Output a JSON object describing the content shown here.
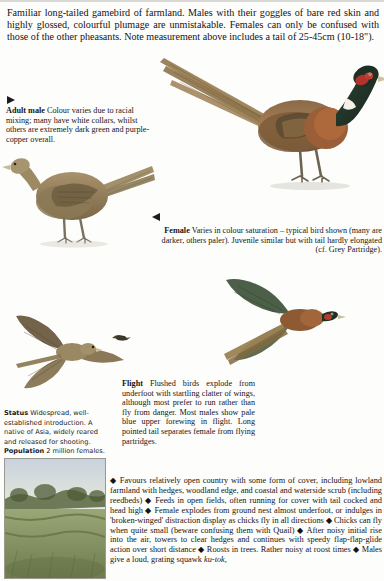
{
  "page": {
    "intro": "Familiar long-tailed gamebird of  farmland. Males with their goggles of bare red skin and highly glossed, colourful plumage are unmistakable. Females can only be confused with those of the other pheasants. Note measurement above includes a tail of 25-45cm (10-18\")."
  },
  "captions": {
    "male": {
      "label": "Adult male",
      "text": " Colour varies due to racial mixing; many have white collars, whilst others are extremely dark green and purple-copper overall."
    },
    "female": {
      "label": "Female",
      "text": " Varies in colour saturation – typical bird shown (many are darker, others paler). Juvenile similar but with tail hardly elongated (cf. Grey Partridge)."
    },
    "flight": {
      "label": "Flight",
      "text": " Flushed birds explode from underfoot with startling clatter of wings, although most prefer to run rather than fly from danger. Most males show pale blue upper forewing in flight. Long pointed tail separates female from flying partridges."
    }
  },
  "status": {
    "label": "Status",
    "text": " Widespread, well-established introduction. A native of Asia, widely reared and released for shooting. ",
    "population_label": "Population",
    "population_text": " 2 million females."
  },
  "habits": {
    "bullet": "◆",
    "items": [
      "Favours relatively open country with some form of cover, including lowland farmland with hedges, woodland edge, and coastal and waterside scrub (including reedbeds)",
      "Feeds in open fields, often running for cover with tail cocked and head high",
      "Female explodes from ground nest almost underfoot, or indulges in 'broken-winged' distraction display as chicks fly in all directions",
      "Chicks can fly when quite small (beware confusing them with Quail)",
      "After noisy initial rise into the air, towers to clear hedges and continues with speedy flap-flap-glide action over short distance",
      "Roosts in trees. Rather noisy at roost times",
      "Males give a loud, grating squawk"
    ],
    "call": "ku-tok,"
  },
  "illustrations": [
    {
      "name": "adult-male-pheasant",
      "caption_ref": "male"
    },
    {
      "name": "female-pheasant",
      "caption_ref": "female"
    },
    {
      "name": "female-in-flight",
      "caption_ref": "flight"
    },
    {
      "name": "male-in-flight",
      "caption_ref": "flight"
    },
    {
      "name": "distant-flying-bird",
      "caption_ref": "flight"
    },
    {
      "name": "habitat-photo",
      "caption_ref": ""
    }
  ],
  "colors": {
    "page_background": "#fdfdfc",
    "text": "#141414",
    "rule": "#d8d8d4",
    "habitat_tint": "#e9ece4"
  }
}
